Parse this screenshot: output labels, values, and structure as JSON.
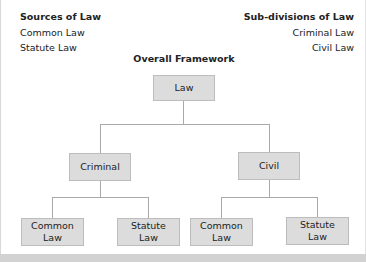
{
  "sources": {
    "title": "Sources of Law",
    "items": [
      "Common Law",
      "Statute Law"
    ]
  },
  "subdivisions": {
    "title": "Sub-divisions of Law",
    "items": [
      "Criminal Law",
      "Civil Law"
    ]
  },
  "framework": {
    "title": "Overall Framework",
    "root": "Law",
    "branches": [
      {
        "label": "Criminal",
        "children": [
          {
            "line1": "Common",
            "line2": "Law"
          },
          {
            "line1": "Statute",
            "line2": "Law"
          }
        ]
      },
      {
        "label": "Civil",
        "children": [
          {
            "line1": "Common",
            "line2": "Law"
          },
          {
            "line1": "Statute",
            "line2": "Law"
          }
        ]
      }
    ]
  },
  "colors": {
    "node_fill": "#dcdcdc",
    "node_border": "#bcbcbc",
    "connector": "#a9a9a9"
  }
}
